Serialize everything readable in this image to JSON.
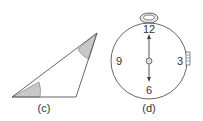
{
  "figures": [
    {
      "id": "c",
      "caption": "(c)",
      "shape": "triangle",
      "shaded_angles": 2,
      "colors": {
        "stroke": "#555555",
        "shade": "#c8c8c8"
      }
    },
    {
      "id": "d",
      "caption": "(d)",
      "shape": "stopwatch",
      "dial_numbers": [
        "12",
        "3",
        "6",
        "9"
      ],
      "hand_directions": [
        "up",
        "down"
      ],
      "colors": {
        "stroke": "#555555",
        "crown_fill": "#e0e0e0"
      }
    }
  ]
}
